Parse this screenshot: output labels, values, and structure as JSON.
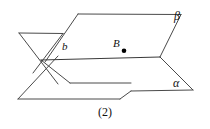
{
  "figure": {
    "caption": "(2)",
    "labels": {
      "plane_upper": "β",
      "plane_lower": "α",
      "line_of_intersection": "b",
      "point": "B"
    },
    "colors": {
      "stroke": "#4a4a4a",
      "stroke_dark": "#2b2b2b",
      "point_fill": "#000000",
      "background": "#ffffff",
      "text": "#111111"
    },
    "geometry": {
      "type": "two-intersecting-planes",
      "description": "Two parallelograms representing planes alpha and beta intersecting along line b through point B",
      "plane_beta_points": "78,14 180,15 160,57 58,56",
      "plane_alpha_points": "18,99 120,99 192,90 90,90",
      "line_b_points": "41,60 160,57",
      "point_B": {
        "x": 124,
        "y": 50
      }
    }
  }
}
